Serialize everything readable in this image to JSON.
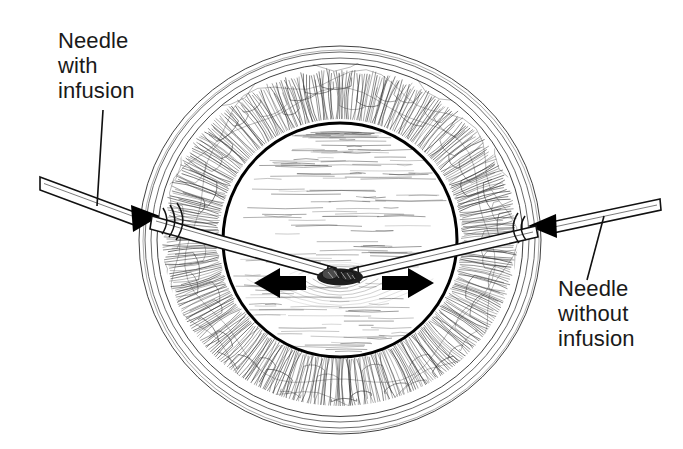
{
  "figure": {
    "background_color": "#ffffff",
    "ink_color": "#1a1a1a",
    "width": 683,
    "height": 449
  },
  "labels": {
    "left": {
      "name": "needle-with-infusion-label",
      "lines": [
        "Needle",
        "with",
        "infusion"
      ],
      "line1": "Needle",
      "line2": "with",
      "line3": "infusion",
      "x": 58,
      "y_lines": [
        48,
        73,
        98
      ]
    },
    "right": {
      "name": "needle-without-infusion-label",
      "lines": [
        "Needle",
        "without",
        "infusion"
      ],
      "line1": "Needle",
      "line2": "without",
      "line3": "infusion",
      "x": 558,
      "y_lines": [
        296,
        321,
        346
      ]
    }
  },
  "anatomy": {
    "globe": {
      "label": "eye-globe",
      "center_x": 340,
      "center_y": 240,
      "outer_rx": 201,
      "outer_ry": 194,
      "sclera_ring_count": 4,
      "choroid_outer_r": 178,
      "choroid_inner_r": 121,
      "vitreous_r": 117,
      "vitreous_outline_color": "#000000"
    },
    "lesion": {
      "label": "central-lesion",
      "x": 340,
      "y": 277,
      "width": 44,
      "height": 16,
      "fill": "#1c1c1c"
    }
  },
  "arrows": {
    "left": {
      "name": "left-traction-arrow",
      "direction": "left",
      "tail_x": 306,
      "tip_x": 254,
      "y": 283,
      "color": "#000000"
    },
    "right": {
      "name": "right-traction-arrow",
      "direction": "right",
      "tail_x": 382,
      "tip_x": 434,
      "y": 283,
      "color": "#000000"
    }
  },
  "needles": {
    "left": {
      "name": "left-needle-with-infusion",
      "entry_side": "left",
      "outer_x": 40,
      "outer_y": 182,
      "tip_x": 336,
      "tip_y": 272,
      "has_infusion": true,
      "leader_from": [
        103,
        110
      ],
      "leader_to": [
        97,
        206
      ]
    },
    "right": {
      "name": "right-needle-without-infusion",
      "entry_side": "right",
      "outer_x": 660,
      "outer_y": 206,
      "tip_x": 346,
      "tip_y": 274,
      "has_infusion": false,
      "leader_from": [
        604,
        216
      ],
      "leader_to": [
        587,
        280
      ]
    }
  }
}
